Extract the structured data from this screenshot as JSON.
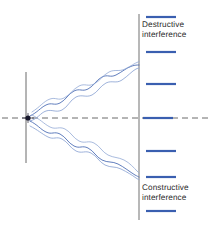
{
  "figure": {
    "background_color": "#ffffff"
  },
  "labels": {
    "destructive": {
      "line1": "Destructive",
      "line2": "interference",
      "x": 142,
      "y": 20,
      "color": "#2b2b2b"
    },
    "constructive": {
      "line1": "Constructive",
      "line2": "interference",
      "x": 142,
      "y": 183,
      "color": "#2b2b2b"
    }
  },
  "colors": {
    "wave_blue": "#4f6fb5",
    "wave_blue_light": "#93a9d6",
    "fringe_blue": "#3a5fb0",
    "axis_gray": "#6b6b6b",
    "screen_gray": "#9a9a9a",
    "barrier_gray": "#6b6b6b",
    "source_dark": "#1a1a2e",
    "text": "#2b2b2b"
  },
  "barrier": {
    "label": "slit-barrier",
    "x": 26,
    "y_top": 72,
    "y_bottom": 163,
    "stroke_width": 1
  },
  "source": {
    "label": "point-source",
    "x": 28,
    "y": 118,
    "radius": 2.6
  },
  "optical_axis": {
    "label": "optical-axis",
    "y": 118,
    "x_start": 2,
    "x_end": 209,
    "dash": "6 4"
  },
  "screen": {
    "label": "detection-screen",
    "x": 139,
    "y_top": 14,
    "y_bottom": 220,
    "stroke_width": 1.4
  },
  "fringes": {
    "x_start": 146,
    "x_end": 176,
    "thickness": 2.2,
    "bars": [
      {
        "id": "fringe-1",
        "y": 17,
        "type": "bright"
      },
      {
        "id": "fringe-2",
        "y": 52,
        "type": "bright"
      },
      {
        "id": "fringe-3",
        "y": 84,
        "type": "bright"
      },
      {
        "id": "fringe-4",
        "y": 118,
        "type": "bright-central"
      },
      {
        "id": "fringe-5",
        "y": 151,
        "type": "bright"
      },
      {
        "id": "fringe-6",
        "y": 177,
        "type": "bright"
      },
      {
        "id": "fringe-7",
        "y": 211,
        "type": "bright"
      }
    ]
  },
  "rays": {
    "upper_bundle": {
      "label": "upper-wave-bundle",
      "origin_x": 28,
      "origin_y": 118,
      "screen_x": 139,
      "screen_y": 68,
      "wave_count": 2
    },
    "lower_bundle": {
      "label": "lower-wave-bundle",
      "origin_x": 28,
      "origin_y": 118,
      "screen_x": 139,
      "screen_y": 177,
      "wave_count": 2
    }
  }
}
